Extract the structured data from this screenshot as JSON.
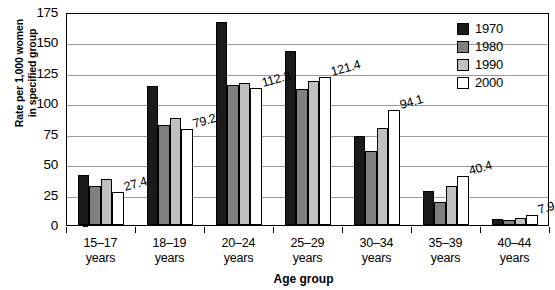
{
  "chart_data": {
    "type": "bar",
    "title": "",
    "xlabel": "Age group",
    "ylabel": "Rate per 1,000 women in specified group",
    "ylabel_line1": "Rate per 1,000 women",
    "ylabel_line2": "in specified group",
    "categories": [
      "15–17 years",
      "18–19 years",
      "20–24 years",
      "25–29 years",
      "30–34 years",
      "35–39 years",
      "40–44 years"
    ],
    "category_lines": [
      [
        "15–17",
        "years"
      ],
      [
        "18–19",
        "years"
      ],
      [
        "20–24",
        "years"
      ],
      [
        "25–29",
        "years"
      ],
      [
        "30–34",
        "years"
      ],
      [
        "35–39",
        "years"
      ],
      [
        "40–44",
        "years"
      ]
    ],
    "series": [
      {
        "name": "1970",
        "color": "#1a1a1a",
        "values": [
          41.0,
          114.0,
          167.0,
          143.0,
          73.0,
          28.0,
          5.0
        ]
      },
      {
        "name": "1980",
        "color": "#808080",
        "values": [
          32.0,
          82.0,
          115.0,
          112.0,
          61.0,
          19.0,
          4.0
        ]
      },
      {
        "name": "1990",
        "color": "#c0c0c0",
        "values": [
          38.0,
          88.0,
          117.0,
          118.0,
          80.0,
          32.0,
          6.0
        ]
      },
      {
        "name": "2000",
        "color": "#ffffff",
        "values": [
          27.4,
          79.2,
          112.3,
          121.4,
          94.1,
          40.4,
          7.9
        ]
      }
    ],
    "data_labels": {
      "series": "2000",
      "values": [
        "27.4",
        "79.2",
        "112.3",
        "121.4",
        "94.1",
        "40.4",
        "7.9"
      ]
    },
    "ylim": [
      0,
      175
    ],
    "yticks": [
      0,
      25,
      50,
      75,
      100,
      125,
      150,
      175
    ],
    "ytick_labels": [
      "0",
      "25",
      "50",
      "75",
      "100",
      "125",
      "150",
      "175"
    ],
    "grid": true,
    "grid_axis": "y",
    "legend_position": "top-right",
    "legend_entries": [
      "1970",
      "1980",
      "1990",
      "2000"
    ]
  }
}
